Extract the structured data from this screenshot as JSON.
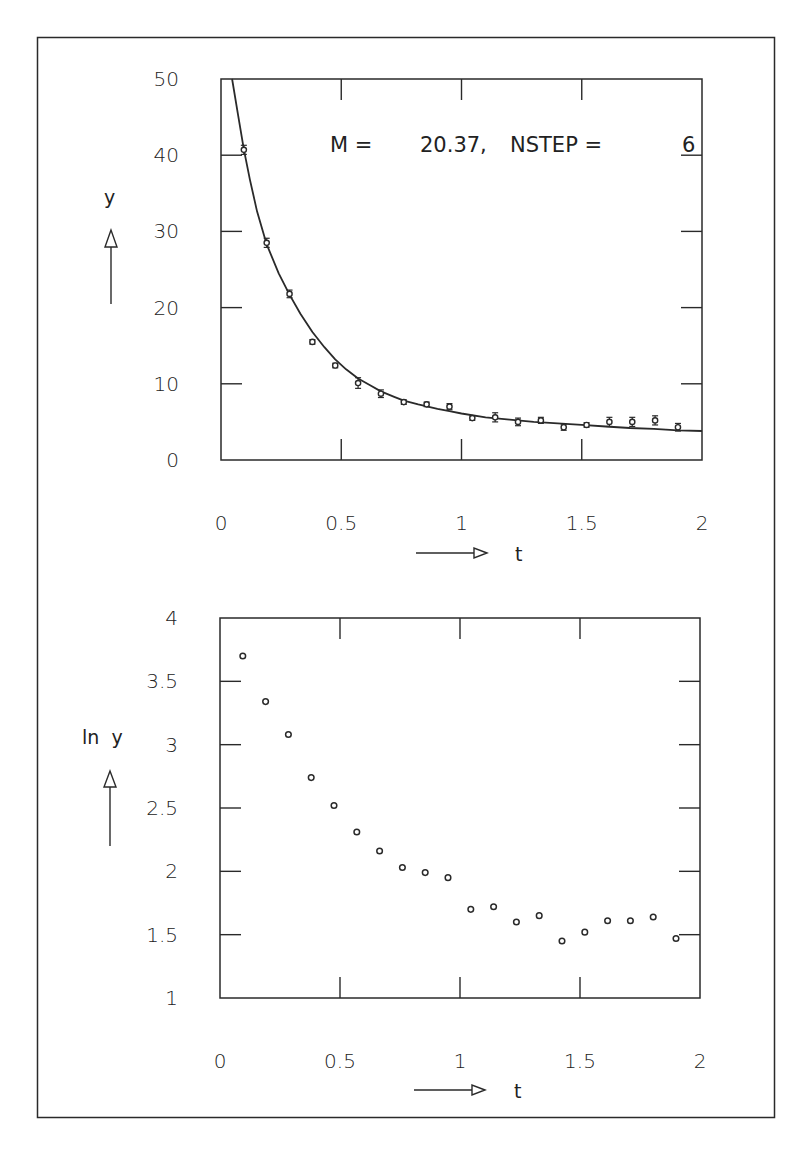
{
  "colors": {
    "ink": "#2a2a2a",
    "background": "#ffffff"
  },
  "chart_data": [
    {
      "type": "scatter",
      "title": "",
      "annotation": "M  =    20.37,  NSTEP  =     6",
      "annotation_parts": {
        "m_label": "M  =",
        "m_value": "20.37,",
        "nstep_label": "NSTEP  =",
        "nstep_value": "6"
      },
      "xlabel": "t",
      "ylabel": "y",
      "xlim": [
        0,
        2
      ],
      "ylim": [
        0,
        50
      ],
      "xticks": [
        0,
        0.5,
        1,
        1.5,
        2
      ],
      "xtick_labels": [
        "0",
        "0.5",
        "1",
        "1.5",
        "2"
      ],
      "yticks": [
        0,
        10,
        20,
        30,
        40,
        50
      ],
      "ytick_labels": [
        "0",
        "10",
        "20",
        "30",
        "40",
        "50"
      ],
      "grid": false,
      "legend": null,
      "series": [
        {
          "name": "data",
          "marker": "circle-with-errorbars",
          "x": [
            0.095,
            0.19,
            0.285,
            0.38,
            0.475,
            0.57,
            0.665,
            0.76,
            0.855,
            0.95,
            1.045,
            1.14,
            1.235,
            1.33,
            1.425,
            1.52,
            1.615,
            1.71,
            1.805,
            1.9
          ],
          "y": [
            40.7,
            28.5,
            21.8,
            15.5,
            12.4,
            10.1,
            8.7,
            7.6,
            7.3,
            7.0,
            5.5,
            5.6,
            5.0,
            5.2,
            4.3,
            4.6,
            5.0,
            5.0,
            5.2,
            4.3
          ],
          "yerr": [
            0.6,
            0.6,
            0.5,
            0.3,
            0.3,
            0.7,
            0.5,
            0.3,
            0.3,
            0.4,
            0.3,
            0.6,
            0.5,
            0.4,
            0.4,
            0.3,
            0.6,
            0.6,
            0.6,
            0.5
          ]
        },
        {
          "name": "fit",
          "type": "line",
          "model": "y = A / t^p + C approx. decaying fit",
          "x": [
            0.046,
            0.07,
            0.095,
            0.12,
            0.15,
            0.19,
            0.24,
            0.285,
            0.33,
            0.38,
            0.43,
            0.475,
            0.52,
            0.57,
            0.62,
            0.665,
            0.72,
            0.76,
            0.82,
            0.9,
            0.95,
            1.0,
            1.1,
            1.2,
            1.3,
            1.4,
            1.5,
            1.6,
            1.7,
            1.8,
            1.9,
            2.0
          ],
          "y": [
            50,
            45.5,
            40.8,
            36.8,
            32.6,
            28.3,
            24.5,
            21.7,
            19.2,
            16.8,
            14.8,
            13.2,
            11.9,
            10.7,
            9.8,
            9.0,
            8.3,
            7.8,
            7.3,
            6.7,
            6.4,
            6.1,
            5.6,
            5.3,
            5.0,
            4.8,
            4.6,
            4.4,
            4.2,
            4.1,
            3.9,
            3.8
          ]
        }
      ]
    },
    {
      "type": "scatter",
      "title": "",
      "xlabel": "t",
      "ylabel": "ln  y",
      "xlim": [
        0,
        2
      ],
      "ylim": [
        1,
        4
      ],
      "xticks": [
        0,
        0.5,
        1,
        1.5,
        2
      ],
      "xtick_labels": [
        "0",
        "0.5",
        "1",
        "1.5",
        "2"
      ],
      "yticks": [
        1,
        1.5,
        2,
        2.5,
        3,
        3.5,
        4
      ],
      "ytick_labels": [
        "1",
        "1.5",
        "2",
        "2.5",
        "3",
        "3.5",
        "4"
      ],
      "grid": false,
      "legend": null,
      "series": [
        {
          "name": "ln y",
          "marker": "open-circle",
          "x": [
            0.095,
            0.19,
            0.285,
            0.38,
            0.475,
            0.57,
            0.665,
            0.76,
            0.855,
            0.95,
            1.045,
            1.14,
            1.235,
            1.33,
            1.425,
            1.52,
            1.615,
            1.71,
            1.805,
            1.9
          ],
          "y": [
            3.7,
            3.34,
            3.08,
            2.74,
            2.52,
            2.31,
            2.16,
            2.03,
            1.99,
            1.95,
            1.7,
            1.72,
            1.6,
            1.65,
            1.45,
            1.52,
            1.61,
            1.61,
            1.64,
            1.47
          ]
        }
      ]
    }
  ]
}
